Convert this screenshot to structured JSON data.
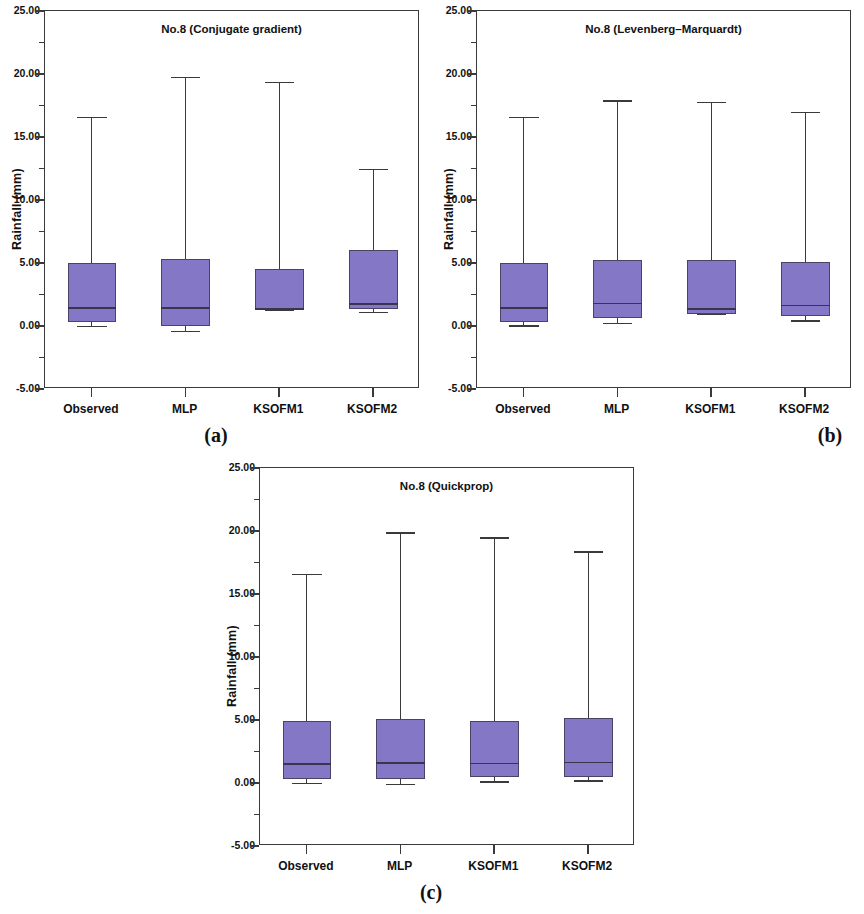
{
  "figure": {
    "axis_color": "#3a3a3a",
    "box_fill": "#8478c6",
    "box_stroke": "#4b4268"
  },
  "panels": [
    {
      "letter": "(a)",
      "title": "No.8 (Conjugate gradient)",
      "ylabel": "Rainfall (mm)"
    },
    {
      "letter": "(b)",
      "title": "No.8 (Levenberg–Marquardt)",
      "ylabel": "Rainfall (mm)"
    },
    {
      "letter": "(c)",
      "title": "No.8 (Quickprop)",
      "ylabel": "Rainfall (mm)"
    }
  ],
  "axis": {
    "ytick_labels": [
      "25.00",
      "20.00",
      "15.00",
      "10.00",
      "5.00",
      "0.00",
      "-5.00"
    ],
    "ytick_values": [
      25,
      20,
      15,
      10,
      5,
      0,
      -5
    ],
    "yminor_values": [
      22.5,
      17.5,
      12.5,
      7.5,
      2.5,
      -2.5
    ],
    "ylim": [
      -5,
      25
    ],
    "categories": [
      "Observed",
      "MLP",
      "KSOFM1",
      "KSOFM2"
    ]
  },
  "chart_data": [
    {
      "type": "box",
      "title": "No.8 (Conjugate gradient)",
      "panel": "(a)",
      "xlabel": "",
      "ylabel": "Rainfall (mm)",
      "ylim": [
        -5,
        25
      ],
      "yticks": [
        -5,
        0,
        5,
        10,
        15,
        20,
        25
      ],
      "grid": false,
      "legend": "none",
      "categories": [
        "Observed",
        "MLP",
        "KSOFM1",
        "KSOFM2"
      ],
      "boxes": [
        {
          "label": "Observed",
          "whisker_low": 0.0,
          "q1": 0.35,
          "median": 1.5,
          "q3": 5.0,
          "whisker_high": 16.6
        },
        {
          "label": "MLP",
          "whisker_low": -0.4,
          "q1": 0.0,
          "median": 1.5,
          "q3": 5.3,
          "whisker_high": 19.8
        },
        {
          "label": "KSOFM1",
          "whisker_low": 1.3,
          "q1": 1.3,
          "median": 1.4,
          "q3": 4.5,
          "whisker_high": 19.4
        },
        {
          "label": "KSOFM2",
          "whisker_low": 1.15,
          "q1": 1.35,
          "median": 1.8,
          "q3": 6.0,
          "whisker_high": 12.5
        }
      ]
    },
    {
      "type": "box",
      "title": "No.8 (Levenberg–Marquardt)",
      "panel": "(b)",
      "xlabel": "",
      "ylabel": "Rainfall (mm)",
      "ylim": [
        -5,
        25
      ],
      "yticks": [
        -5,
        0,
        5,
        10,
        15,
        20,
        25
      ],
      "grid": false,
      "legend": "none",
      "categories": [
        "Observed",
        "MLP",
        "KSOFM1",
        "KSOFM2"
      ],
      "boxes": [
        {
          "label": "Observed",
          "whisker_low": 0.05,
          "q1": 0.35,
          "median": 1.5,
          "q3": 5.0,
          "whisker_high": 16.6
        },
        {
          "label": "MLP",
          "whisker_low": 0.25,
          "q1": 0.6,
          "median": 1.85,
          "q3": 5.2,
          "whisker_high": 17.9
        },
        {
          "label": "KSOFM1",
          "whisker_low": 0.95,
          "q1": 0.95,
          "median": 1.4,
          "q3": 5.2,
          "whisker_high": 17.8
        },
        {
          "label": "KSOFM2",
          "whisker_low": 0.45,
          "q1": 0.8,
          "median": 1.7,
          "q3": 5.05,
          "whisker_high": 17.0
        }
      ]
    },
    {
      "type": "box",
      "title": "No.8 (Quickprop)",
      "panel": "(c)",
      "xlabel": "",
      "ylabel": "Rainfall (mm)",
      "ylim": [
        -5,
        25
      ],
      "yticks": [
        -5,
        0,
        5,
        10,
        15,
        20,
        25
      ],
      "grid": false,
      "legend": "none",
      "categories": [
        "Observed",
        "MLP",
        "KSOFM1",
        "KSOFM2"
      ],
      "boxes": [
        {
          "label": "Observed",
          "whisker_low": 0.0,
          "q1": 0.3,
          "median": 1.55,
          "q3": 4.95,
          "whisker_high": 16.6
        },
        {
          "label": "MLP",
          "whisker_low": -0.05,
          "q1": 0.35,
          "median": 1.65,
          "q3": 5.1,
          "whisker_high": 19.9
        },
        {
          "label": "KSOFM1",
          "whisker_low": 0.15,
          "q1": 0.5,
          "median": 1.6,
          "q3": 4.95,
          "whisker_high": 19.5
        },
        {
          "label": "KSOFM2",
          "whisker_low": 0.2,
          "q1": 0.5,
          "median": 1.7,
          "q3": 5.15,
          "whisker_high": 18.4
        }
      ]
    }
  ]
}
